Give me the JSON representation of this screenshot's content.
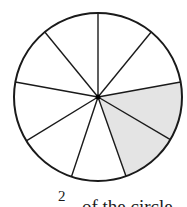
{
  "diagram": {
    "type": "fraction-circle",
    "total_parts": 9,
    "shaded_parts": 2,
    "shade_color": "#e4e4e4",
    "stroke_color": "#1a1a1a",
    "center": [
      98,
      97
    ],
    "radius": 84,
    "spoke_endpoints": [
      [
        98,
        13
      ],
      [
        152,
        31
      ],
      [
        181,
        82
      ],
      [
        171,
        140
      ],
      [
        127,
        179
      ],
      [
        70,
        181
      ],
      [
        26,
        141
      ],
      [
        15,
        82
      ],
      [
        44,
        31
      ]
    ],
    "shaded_wedges": [
      [
        2,
        3
      ],
      [
        3,
        4
      ]
    ]
  },
  "caption": {
    "numerator": "2",
    "text": "of the circle"
  }
}
